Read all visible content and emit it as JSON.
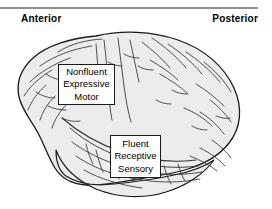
{
  "figure": {
    "name": "lateral-brain-language-areas",
    "width": 272,
    "height": 209,
    "background_color": "#ffffff",
    "rule_color": "#8f8f8f"
  },
  "orientation": {
    "anterior_label": "Anterior",
    "posterior_label": "Posterior"
  },
  "brain": {
    "fill_color": "#ececec",
    "outline_color": "#1a1a1a",
    "sulci_color": "#333333",
    "view": "left lateral"
  },
  "callouts": [
    {
      "id": "anterior-language-area",
      "lines": [
        "Nonfluent",
        "Expressive",
        "Motor"
      ]
    },
    {
      "id": "posterior-language-area",
      "lines": [
        "Fluent",
        "Receptive",
        "Sensory"
      ]
    }
  ]
}
